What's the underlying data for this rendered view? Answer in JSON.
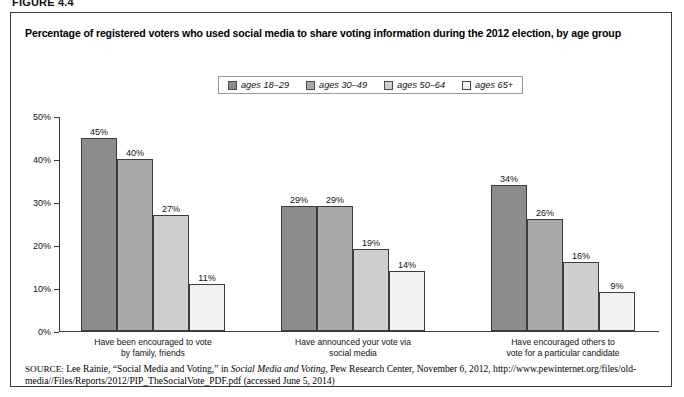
{
  "figure_number": "FIGURE 4.4",
  "figure": {
    "title": "Percentage of registered voters who used social media to share voting information during the 2012 election, by age group",
    "source_prefix": "SOURCE:",
    "source_part1": " Lee Rainie, “Social Media and Voting,” in ",
    "source_italic": "Social Media and Voting",
    "source_part2": ", Pew Research Center, November 6, 2012, http://www.pewinternet.org/files/old-media//Files/Reports/2012/PIP_TheSocialVote_PDF.pdf (accessed June 5, 2014)"
  },
  "chart_data": {
    "type": "bar",
    "title": "Percentage of registered voters who used social media to share voting information during the 2012 election, by age group",
    "xlabel": "",
    "ylabel": "",
    "ylim": [
      0,
      50
    ],
    "ytick_labels": [
      "0%",
      "10%",
      "20%",
      "30%",
      "40%",
      "50%"
    ],
    "ytick_values": [
      0,
      10,
      20,
      30,
      40,
      50
    ],
    "grid": false,
    "legend_position": "top-center",
    "value_suffix": "%",
    "categories": [
      "Have been encouraged to vote\nby family, friends",
      "Have announced your vote via\nsocial media",
      "Have encouraged others to\nvote for a particular candidate"
    ],
    "series": [
      {
        "name": "ages 18–29",
        "color": "#8d8d8d",
        "values": [
          45,
          29,
          34
        ],
        "labels": [
          "45%",
          "29%",
          "34%"
        ]
      },
      {
        "name": "ages 30–49",
        "color": "#a9a9a9",
        "values": [
          40,
          29,
          26
        ],
        "labels": [
          "40%",
          "29%",
          "26%"
        ]
      },
      {
        "name": "ages 50–64",
        "color": "#cfcfcf",
        "values": [
          27,
          19,
          16
        ],
        "labels": [
          "27%",
          "19%",
          "16%"
        ]
      },
      {
        "name": "ages 65+",
        "color": "#f2f2f2",
        "values": [
          11,
          14,
          9
        ],
        "labels": [
          "11%",
          "14%",
          "9%"
        ]
      }
    ]
  }
}
